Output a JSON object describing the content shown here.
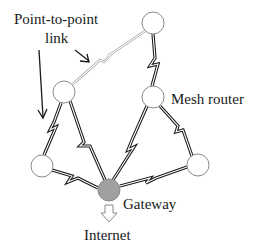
{
  "diagram": {
    "labels": {
      "point_to_point_line1": "Point-to-point",
      "point_to_point_line2": "link",
      "mesh_router": "Mesh router",
      "gateway": "Gateway",
      "internet": "Internet"
    },
    "nodes": [
      {
        "id": "top",
        "type": "mesh-router",
        "cx": 153,
        "cy": 23
      },
      {
        "id": "left-mid",
        "type": "mesh-router",
        "cx": 64,
        "cy": 92
      },
      {
        "id": "mesh-router",
        "type": "mesh-router",
        "cx": 153,
        "cy": 97
      },
      {
        "id": "bottom-left",
        "type": "mesh-router",
        "cx": 42,
        "cy": 166
      },
      {
        "id": "gateway",
        "type": "gateway",
        "cx": 109,
        "cy": 190
      },
      {
        "id": "bottom-right",
        "type": "mesh-router",
        "cx": 198,
        "cy": 165
      }
    ],
    "links": [
      {
        "from": "top",
        "to": "left-mid",
        "style": "thin"
      },
      {
        "from": "top",
        "to": "mesh-router",
        "style": "thick"
      },
      {
        "from": "left-mid",
        "to": "bottom-left",
        "style": "thick"
      },
      {
        "from": "left-mid",
        "to": "gateway",
        "style": "thick"
      },
      {
        "from": "mesh-router",
        "to": "gateway",
        "style": "thick"
      },
      {
        "from": "mesh-router",
        "to": "bottom-right",
        "style": "thick"
      },
      {
        "from": "bottom-left",
        "to": "gateway",
        "style": "thick"
      },
      {
        "from": "gateway",
        "to": "bottom-right",
        "style": "thick"
      }
    ],
    "colors": {
      "node_fill": "#ffffff",
      "node_stroke": "#8a8a8a",
      "gateway_fill": "#a0a0a0",
      "link": "#1a1a1a",
      "thin_link": "#9a9a9a",
      "text": "#1a1a1a"
    }
  }
}
